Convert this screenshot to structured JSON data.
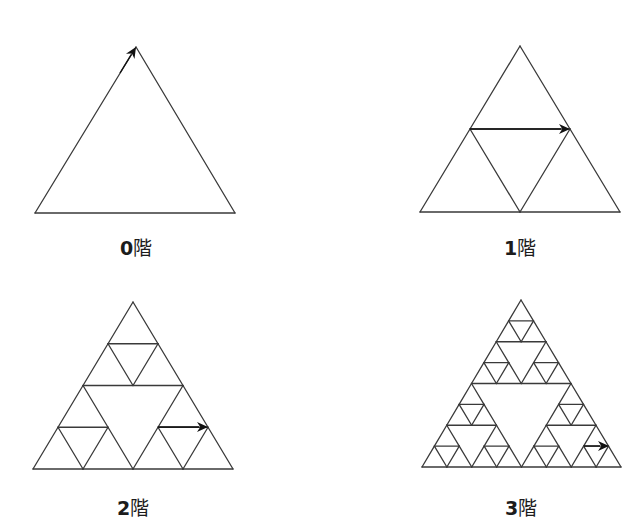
{
  "style": {
    "line_color": "#3a3a3a",
    "line_width": 1.3,
    "arrow_color": "#111111",
    "background": "#ffffff"
  },
  "panels": [
    {
      "id": "order-0",
      "label_num": "0",
      "label_suffix": "階",
      "level": 0,
      "apex": [
        136,
        47
      ],
      "base_left": [
        35,
        213
      ],
      "base_right": [
        235,
        213
      ],
      "label_center": [
        136,
        245
      ],
      "arrow": {
        "from": [
          120,
          73
        ],
        "to": [
          136,
          47
        ]
      }
    },
    {
      "id": "order-1",
      "label_num": "1",
      "label_suffix": "階",
      "level": 1,
      "apex": [
        520,
        46
      ],
      "base_left": [
        420,
        212
      ],
      "base_right": [
        620,
        212
      ],
      "label_center": [
        520,
        245
      ],
      "arrow": {
        "from": [
          470,
          129
        ],
        "to": [
          570,
          129
        ]
      }
    },
    {
      "id": "order-2",
      "label_num": "2",
      "label_suffix": "階",
      "level": 2,
      "apex": [
        133,
        302
      ],
      "base_left": [
        33,
        469
      ],
      "base_right": [
        233,
        469
      ],
      "label_center": [
        133,
        505
      ],
      "arrow": {
        "from": [
          158,
          427
        ],
        "to": [
          208,
          427
        ]
      }
    },
    {
      "id": "order-3",
      "label_num": "3",
      "label_suffix": "階",
      "level": 3,
      "apex": [
        521,
        300
      ],
      "base_left": [
        422,
        467
      ],
      "base_right": [
        621,
        467
      ],
      "label_center": [
        521,
        505
      ],
      "arrow": {
        "from": [
          584,
          446
        ],
        "to": [
          609,
          446
        ]
      }
    }
  ]
}
